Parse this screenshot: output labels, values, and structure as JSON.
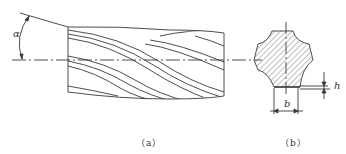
{
  "figure": {
    "colors": {
      "stroke": "#3a3a3a",
      "hatch": "#5a5a5a",
      "background": "#ffffff"
    },
    "view_a": {
      "caption": "（a）",
      "angle_label": "α",
      "description": "side view of helically fluted shaft with helix angle"
    },
    "view_b": {
      "caption": "（b）",
      "depth_label": "h",
      "width_label": "b",
      "description": "hatched cross-section with flute depth and width dimensions"
    }
  }
}
